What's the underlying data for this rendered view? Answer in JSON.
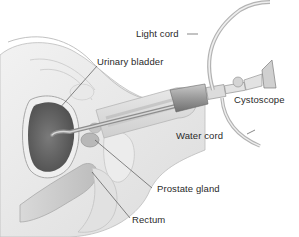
{
  "diagram": {
    "style": "grayscale medical illustration",
    "labels": [
      {
        "id": "light-cord",
        "text": "Light cord"
      },
      {
        "id": "urinary-bladder",
        "text": "Urinary bladder"
      },
      {
        "id": "cystoscope",
        "text": "Cystoscope"
      },
      {
        "id": "water-cord",
        "text": "Water cord"
      },
      {
        "id": "prostate-gland",
        "text": "Prostate gland"
      },
      {
        "id": "rectum",
        "text": "Rectum"
      }
    ],
    "colors": {
      "background": "#ffffff",
      "label_text": "#2a2a2a",
      "leader_line": "#555555",
      "tissue_light": "#e4e4e4",
      "tissue_mid": "#c8c8c8",
      "bladder_dark": "#6a6a6a",
      "instrument": "#9a9a9a"
    }
  }
}
